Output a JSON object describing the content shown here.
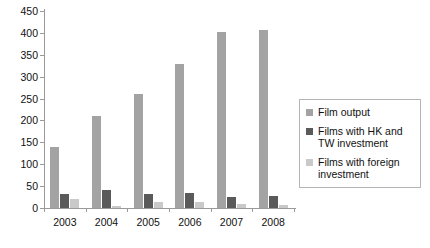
{
  "chart_data": {
    "type": "bar",
    "title": "",
    "subtitle": "",
    "xlabel": "",
    "ylabel": "",
    "categories": [
      "2003",
      "2004",
      "2005",
      "2006",
      "2007",
      "2008"
    ],
    "series": [
      {
        "name": "Film output",
        "color": "#a3a3a3",
        "values": [
          140,
          210,
          260,
          330,
          402,
          406
        ]
      },
      {
        "name": "Films with HK and TW investment",
        "color": "#5a5a5a",
        "values": [
          32,
          42,
          32,
          34,
          25,
          27
        ]
      },
      {
        "name": "Films with foreign investment",
        "color": "#c9c9c9",
        "values": [
          20,
          5,
          14,
          14,
          10,
          8
        ]
      }
    ],
    "ylim": [
      0,
      450
    ],
    "yticks": [
      0,
      50,
      100,
      150,
      200,
      250,
      300,
      350,
      400,
      450
    ],
    "ytick_labels": [
      "0",
      "50",
      "100",
      "150",
      "200",
      "250",
      "300",
      "350",
      "400",
      "450"
    ],
    "grid": false,
    "legend_position": "right",
    "legend_entries": [
      "Film output",
      "Films with HK and TW investment",
      "Films with foreign investment"
    ]
  },
  "axis": {
    "line_color": "#9a9a9a"
  }
}
